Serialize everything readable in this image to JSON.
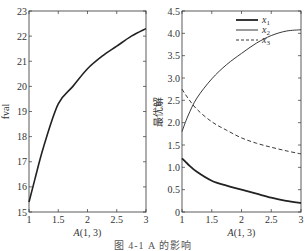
{
  "caption": "图 4-1  A 的影响",
  "chart_data": [
    {
      "type": "line",
      "title": "",
      "xlabel": "A(1, 3)",
      "ylabel": "fval",
      "xlim": [
        1,
        3
      ],
      "ylim": [
        15,
        23
      ],
      "xticks": [
        1,
        1.5,
        2,
        2.5,
        3
      ],
      "xtick_labels": [
        "1",
        "1.5",
        "2",
        "2.5",
        "3"
      ],
      "yticks": [
        15,
        16,
        17,
        18,
        19,
        20,
        21,
        22,
        23
      ],
      "ytick_labels": [
        "15",
        "16",
        "17",
        "18",
        "19",
        "20",
        "21",
        "22",
        "23"
      ],
      "grid": false,
      "x": [
        1,
        1.1,
        1.25,
        1.5,
        1.75,
        2,
        2.25,
        2.5,
        2.75,
        3
      ],
      "series": [
        {
          "name": "fval",
          "style": "solid",
          "width": 1.6,
          "values": [
            15.4,
            16.3,
            17.6,
            19.3,
            20.0,
            20.7,
            21.2,
            21.6,
            22.0,
            22.3
          ]
        }
      ]
    },
    {
      "type": "line",
      "title": "",
      "xlabel": "A(1, 3)",
      "ylabel": "最优解",
      "xlim": [
        1,
        3
      ],
      "ylim": [
        0,
        4.5
      ],
      "xticks": [
        1,
        1.5,
        2,
        2.5,
        3
      ],
      "xtick_labels": [
        "1",
        "1.5",
        "2",
        "2.5",
        "3"
      ],
      "yticks": [
        0,
        0.5,
        1.0,
        1.5,
        2.0,
        2.5,
        3.0,
        3.5,
        4.0,
        4.5
      ],
      "ytick_labels": [
        "0",
        "0.5",
        "1.0",
        "1.5",
        "2.0",
        "2.5",
        "3.0",
        "3.5",
        "4.0",
        "4.5"
      ],
      "grid": false,
      "legend_position": "upper right",
      "x": [
        1,
        1.1,
        1.25,
        1.5,
        1.75,
        2,
        2.25,
        2.5,
        2.75,
        3
      ],
      "series": [
        {
          "name": "x1",
          "label_main": "x",
          "label_sub": "1",
          "style": "solid",
          "width": 1.8,
          "values": [
            1.2,
            1.07,
            0.9,
            0.7,
            0.59,
            0.5,
            0.41,
            0.32,
            0.25,
            0.2
          ]
        },
        {
          "name": "x2",
          "label_main": "x",
          "label_sub": "2",
          "style": "solid",
          "width": 0.9,
          "values": [
            1.8,
            2.15,
            2.55,
            2.98,
            3.3,
            3.55,
            3.78,
            3.95,
            4.05,
            4.08
          ]
        },
        {
          "name": "x3",
          "label_main": "x",
          "label_sub": "3",
          "style": "dashed",
          "width": 0.9,
          "values": [
            2.75,
            2.55,
            2.3,
            2.02,
            1.83,
            1.66,
            1.54,
            1.45,
            1.37,
            1.3
          ]
        }
      ]
    }
  ]
}
